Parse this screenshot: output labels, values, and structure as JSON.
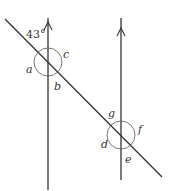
{
  "diagram": {
    "type": "parallel-lines-transversal",
    "colors": {
      "line": "#333333",
      "arc": "#555555",
      "background": "#ffffff"
    },
    "lines": {
      "left_parallel": {
        "x": 48,
        "y1": 18,
        "y2": 190,
        "arrow": "up"
      },
      "right_parallel": {
        "x": 121,
        "y1": 18,
        "y2": 180,
        "arrow": "up"
      },
      "transversal": {
        "x1": 5,
        "y1": 20,
        "x2": 162,
        "y2": 177
      }
    },
    "labels": {
      "given_angle": "43°",
      "a": "a",
      "b": "b",
      "c": "c",
      "d": "d",
      "e": "e",
      "f": "f",
      "g": "g"
    }
  }
}
